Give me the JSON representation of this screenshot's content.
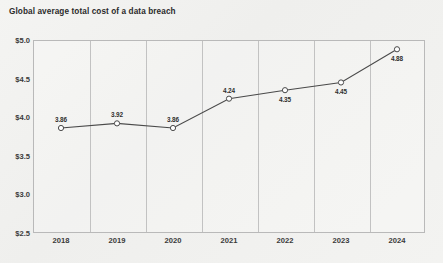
{
  "chart_data": {
    "type": "line",
    "title": "Global average total cost of a data breach",
    "xlabel": "",
    "ylabel": "",
    "categories": [
      "2018",
      "2019",
      "2020",
      "2021",
      "2022",
      "2023",
      "2024"
    ],
    "values": [
      3.86,
      3.92,
      3.86,
      4.24,
      4.35,
      4.45,
      4.88
    ],
    "point_labels": [
      "3.86",
      "3.92",
      "3.86",
      "4.24",
      "4.35",
      "4.45",
      "4.88"
    ],
    "label_positions": [
      "above",
      "above",
      "above",
      "above",
      "below",
      "below",
      "below"
    ],
    "ylim": [
      2.5,
      5.0
    ],
    "ytick_values": [
      5.0,
      4.5,
      4.0,
      3.5,
      3.0,
      2.5
    ],
    "ytick_labels": [
      "$5.0",
      "$4.5",
      "$4.0",
      "$3.5",
      "$3.0",
      "$2.5"
    ],
    "grid": "vertical-only",
    "legend": "none",
    "marker": "open-circle",
    "line_color": "#4a4a4a",
    "marker_face_color": "#ffffff",
    "grid_color": "#c2c2c2",
    "background_color": "#f2f2f0",
    "units": "US$ millions"
  }
}
